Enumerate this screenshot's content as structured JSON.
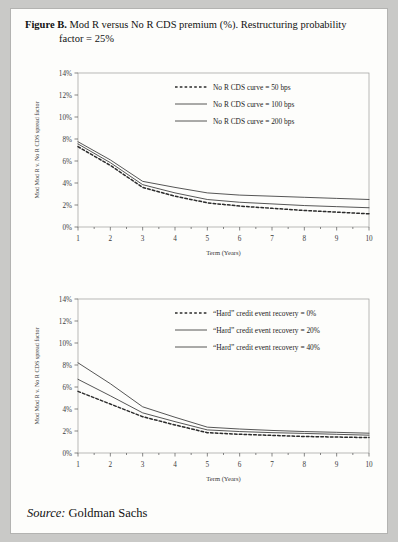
{
  "figure": {
    "label": "Figure B.",
    "caption_line1": "Mod R versus No R CDS premium (%). Restructuring probability",
    "caption_line2": "factor = 25%"
  },
  "source": {
    "label": "Source:",
    "value": "Goldman Sachs"
  },
  "chart_data": [
    {
      "type": "line",
      "id": "chart-top",
      "title": "",
      "xlabel": "Term (Years)",
      "ylabel": "Mod Mod R v. No R CDS spread factor",
      "x": [
        1,
        2,
        3,
        4,
        5,
        6,
        7,
        8,
        9,
        10
      ],
      "xlim": [
        1,
        10
      ],
      "ylim": [
        0,
        14
      ],
      "xticks": [
        1,
        2,
        3,
        4,
        5,
        6,
        7,
        8,
        9,
        10
      ],
      "yticks": [
        0,
        2,
        4,
        6,
        8,
        10,
        12,
        14
      ],
      "ytick_labels": [
        "0%",
        "2%",
        "4%",
        "6%",
        "8%",
        "10%",
        "12%",
        "14%"
      ],
      "grid": false,
      "legend_position": "top-center",
      "series": [
        {
          "name": "No R CDS curve = 50 bps",
          "style": "dashed",
          "values": [
            7.3,
            5.6,
            3.6,
            2.8,
            2.2,
            1.9,
            1.7,
            1.5,
            1.35,
            1.2
          ]
        },
        {
          "name": "No R CDS curve = 100 bps",
          "style": "solid",
          "values": [
            7.55,
            5.85,
            3.85,
            3.1,
            2.5,
            2.25,
            2.1,
            1.95,
            1.85,
            1.75
          ]
        },
        {
          "name": "No R CDS curve = 200 bps",
          "style": "solid",
          "values": [
            7.75,
            6.1,
            4.15,
            3.6,
            3.1,
            2.9,
            2.8,
            2.7,
            2.6,
            2.5
          ]
        }
      ]
    },
    {
      "type": "line",
      "id": "chart-bottom",
      "title": "",
      "xlabel": "Term (Years)",
      "ylabel": "Mod Mod R v. No R CDS spread factor",
      "x": [
        1,
        2,
        3,
        4,
        5,
        6,
        7,
        8,
        9,
        10
      ],
      "xlim": [
        1,
        10
      ],
      "ylim": [
        0,
        14
      ],
      "xticks": [
        1,
        2,
        3,
        4,
        5,
        6,
        7,
        8,
        9,
        10
      ],
      "yticks": [
        0,
        2,
        4,
        6,
        8,
        10,
        12,
        14
      ],
      "ytick_labels": [
        "0%",
        "2%",
        "4%",
        "6%",
        "8%",
        "10%",
        "12%",
        "14%"
      ],
      "grid": false,
      "legend_position": "top-center",
      "series": [
        {
          "name": "“Hard” credit event recovery = 0%",
          "style": "dashed",
          "values": [
            5.6,
            4.45,
            3.3,
            2.55,
            1.85,
            1.7,
            1.6,
            1.5,
            1.45,
            1.4
          ]
        },
        {
          "name": "“Hard” credit event recovery = 20%",
          "style": "solid",
          "values": [
            6.7,
            5.2,
            3.65,
            2.85,
            2.1,
            1.95,
            1.85,
            1.78,
            1.7,
            1.62
          ]
        },
        {
          "name": "“Hard” credit event recovery = 40%",
          "style": "solid",
          "values": [
            8.2,
            6.3,
            4.2,
            3.25,
            2.35,
            2.18,
            2.05,
            1.95,
            1.88,
            1.8
          ]
        }
      ]
    }
  ]
}
